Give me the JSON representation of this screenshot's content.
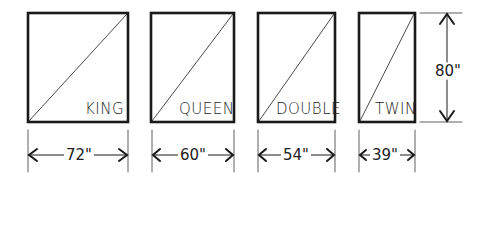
{
  "beds": [
    {
      "name": "KING",
      "width": "72\"",
      "box": {
        "x": 28,
        "y": 13,
        "w": 100,
        "h": 109
      }
    },
    {
      "name": "QUEEN",
      "width": "60\"",
      "box": {
        "x": 151,
        "y": 13,
        "w": 83,
        "h": 109
      }
    },
    {
      "name": "DOUBLE",
      "width": "54\"",
      "box": {
        "x": 258,
        "y": 13,
        "w": 77,
        "h": 109
      }
    },
    {
      "name": "TWIN",
      "width": "39\"",
      "box": {
        "x": 359,
        "y": 13,
        "w": 56,
        "h": 109
      }
    }
  ],
  "length": "80\"",
  "colors": {
    "line": "#1a1a1a",
    "background": "#ffffff"
  }
}
